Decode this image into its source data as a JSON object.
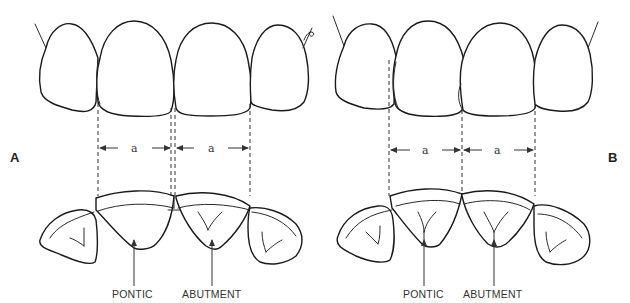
{
  "diagram": {
    "panels": [
      {
        "id": "A",
        "panel_label": "A",
        "dimension_labels": [
          "a",
          "a"
        ],
        "labels": {
          "pontic": "PONTIC",
          "abutment": "ABUTMENT"
        }
      },
      {
        "id": "B",
        "panel_label": "B",
        "dimension_labels": [
          "a",
          "a"
        ],
        "labels": {
          "pontic": "PONTIC",
          "abutment": "ABUTMENT"
        }
      }
    ],
    "colors": {
      "line": "#1a1a1a",
      "background": "#ffffff"
    }
  }
}
